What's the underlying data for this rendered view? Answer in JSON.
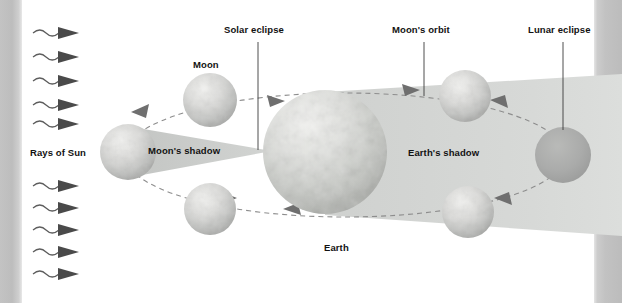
{
  "figure": {
    "type": "astronomy-diagram",
    "palette": {
      "background": "#ffffff",
      "page_edge_gray": "#c0c0c0",
      "text": "#121212",
      "moon_shadow": "#c9cbc9",
      "earth_shadow": "#d6d8d6",
      "orbit_line": "#8d8d8d",
      "arrowhead": "#6f6f6f",
      "ray": "#5d5d5d",
      "eclipsed_moon": "#a9aaa9"
    }
  },
  "labels": {
    "rays_of_sun": "Rays of Sun",
    "moon": "Moon",
    "moons_shadow": "Moon's shadow",
    "solar_eclipse": "Solar eclipse",
    "moons_orbit": "Moon's orbit",
    "lunar_eclipse": "Lunar eclipse",
    "earths_shadow": "Earth's shadow",
    "earth": "Earth"
  },
  "sun_rays": {
    "count": 10,
    "above_label": 5,
    "below_label": 5,
    "description": "wavy arrows pointing right"
  },
  "bodies": [
    {
      "name": "moon-top-left",
      "kind": "moon",
      "cx": 210,
      "cy": 100,
      "r": 27,
      "shaded": false
    },
    {
      "name": "moon-left-new",
      "kind": "moon",
      "cx": 128,
      "cy": 152,
      "r": 28,
      "shaded": false
    },
    {
      "name": "moon-bottom-left",
      "kind": "moon",
      "cx": 210,
      "cy": 209,
      "r": 26,
      "shaded": false
    },
    {
      "name": "earth",
      "kind": "earth",
      "cx": 325,
      "cy": 152,
      "r": 62,
      "shaded": false
    },
    {
      "name": "moon-top-right",
      "kind": "moon",
      "cx": 465,
      "cy": 96,
      "r": 26,
      "shaded": false
    },
    {
      "name": "moon-full-eclipsed",
      "kind": "moon",
      "cx": 563,
      "cy": 155,
      "r": 28,
      "shaded": true
    },
    {
      "name": "moon-bottom-right",
      "kind": "moon",
      "cx": 468,
      "cy": 212,
      "r": 26,
      "shaded": false
    }
  ],
  "orbit": {
    "cx": 345,
    "cy": 155,
    "rx": 220,
    "ry": 62,
    "style": "dashed",
    "arrow_count": 6
  },
  "leader_lines": [
    {
      "name": "solar-eclipse-leader",
      "x": 258,
      "y1": 42,
      "y2": 150
    },
    {
      "name": "moons-orbit-leader",
      "x": 424,
      "y1": 42,
      "y2": 96
    },
    {
      "name": "lunar-eclipse-leader",
      "x": 563,
      "y1": 42,
      "y2": 130
    }
  ]
}
